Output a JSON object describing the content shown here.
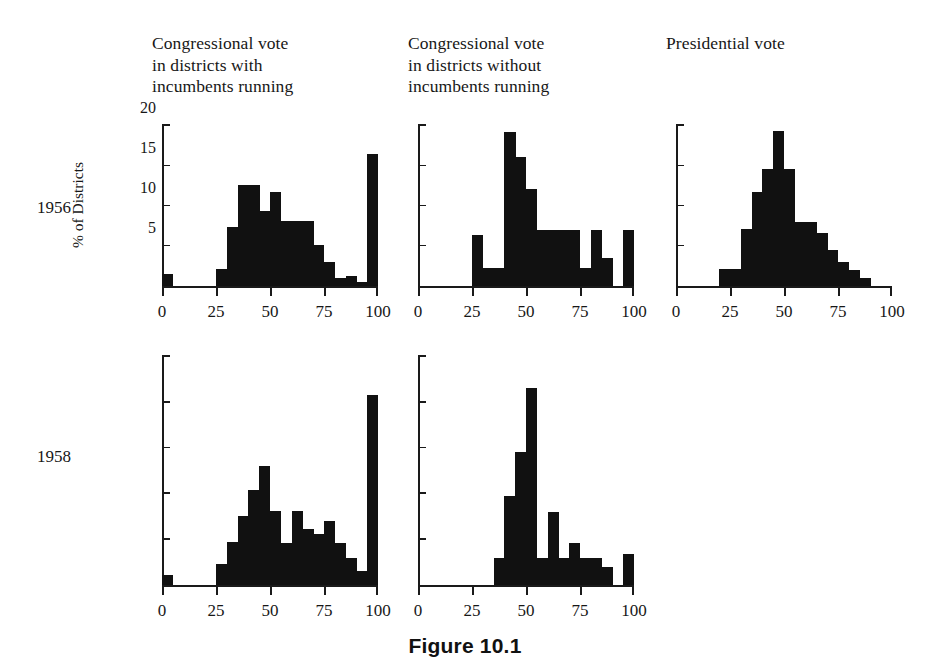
{
  "figure": {
    "caption": "Figure 10.1"
  },
  "axis": {
    "y_caption": "% of Districts",
    "y_tick_labels": [
      "5",
      "10",
      "15",
      "20"
    ],
    "x_tick_labels": [
      "0",
      "25",
      "50",
      "75",
      "100"
    ]
  },
  "columns": [
    {
      "id": "congressional-with-incumbents",
      "title": "Congressional vote\nin districts with\nincumbents running"
    },
    {
      "id": "congressional-without-incumbents",
      "title": "Congressional vote\nin districts without\nincumbents running"
    },
    {
      "id": "presidential",
      "title": "Presidential vote"
    }
  ],
  "rows": [
    {
      "id": "1956",
      "label": "1956"
    },
    {
      "id": "1958",
      "label": "1958"
    }
  ],
  "chart_data": {
    "type": "bar",
    "title": "Figure 10.1",
    "xlabel": "",
    "ylabel": "% of Districts",
    "xlim": [
      0,
      100
    ],
    "ylim": [
      0,
      20
    ],
    "grid": false,
    "legend": "none",
    "bin_width": 5,
    "bin_starts": [
      0,
      5,
      10,
      15,
      20,
      25,
      30,
      35,
      40,
      45,
      50,
      55,
      60,
      65,
      70,
      75,
      80,
      85,
      90,
      95
    ],
    "xticks": [
      0,
      25,
      50,
      75,
      100
    ],
    "yticks": [
      5,
      10,
      15,
      20
    ],
    "panels": [
      {
        "row": "1956",
        "column": "Congressional vote in districts with incumbents running",
        "values": [
          1.6,
          0,
          0,
          0,
          0,
          2.2,
          7.4,
          12.7,
          12.7,
          9.4,
          11.8,
          8.2,
          8.2,
          8.2,
          5.2,
          3.0,
          1.0,
          1.3,
          0.6,
          16.5
        ]
      },
      {
        "row": "1956",
        "column": "Congressional vote in districts without incumbents running",
        "values": [
          0,
          0,
          0,
          0,
          0,
          6.4,
          2.3,
          2.3,
          19.3,
          16.1,
          12.2,
          7.0,
          7.0,
          7.0,
          7.0,
          2.3,
          7.0,
          3.6,
          0,
          7.0
        ]
      },
      {
        "row": "1956",
        "column": "Presidential vote",
        "values": [
          0,
          0,
          0,
          0,
          2.2,
          2.2,
          7.2,
          11.8,
          14.6,
          19.4,
          14.6,
          8.0,
          8.0,
          6.6,
          4.6,
          3.0,
          2.0,
          1.0,
          0,
          0
        ]
      },
      {
        "row": "1958",
        "column": "Congressional vote in districts with incumbents running",
        "values": [
          1.1,
          0,
          0,
          0,
          0,
          2.3,
          4.8,
          7.6,
          10.4,
          13.1,
          8.2,
          4.6,
          8.2,
          6.2,
          5.6,
          7.0,
          4.6,
          3.0,
          1.6,
          20.8
        ]
      },
      {
        "row": "1958",
        "column": "Congressional vote in districts without incumbents running",
        "values": [
          0,
          0,
          0,
          0,
          0,
          0,
          0,
          3.0,
          9.8,
          14.6,
          21.6,
          3.0,
          8.0,
          3.0,
          4.6,
          3.0,
          3.0,
          2.0,
          0,
          3.4
        ]
      }
    ]
  }
}
